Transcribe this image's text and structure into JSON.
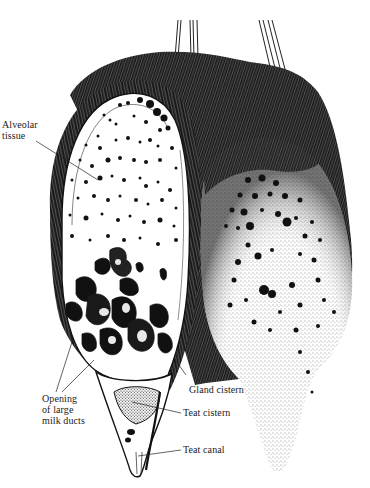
{
  "figure": {
    "colors": {
      "ink": "#111111",
      "paper": "#ffffff",
      "hair": "#1c1c1c"
    }
  },
  "labels": {
    "alveolar_tissue": {
      "line1": "Alveolar",
      "line2": "tissue"
    },
    "opening_large_milk_ducts": {
      "line1": "Opening",
      "line2": "of large",
      "line3": "milk ducts"
    },
    "gland_cistern": {
      "text": "Gland cistern"
    },
    "teat_cistern": {
      "text": "Teat cistern"
    },
    "teat_canal": {
      "text": "Teat canal"
    }
  }
}
